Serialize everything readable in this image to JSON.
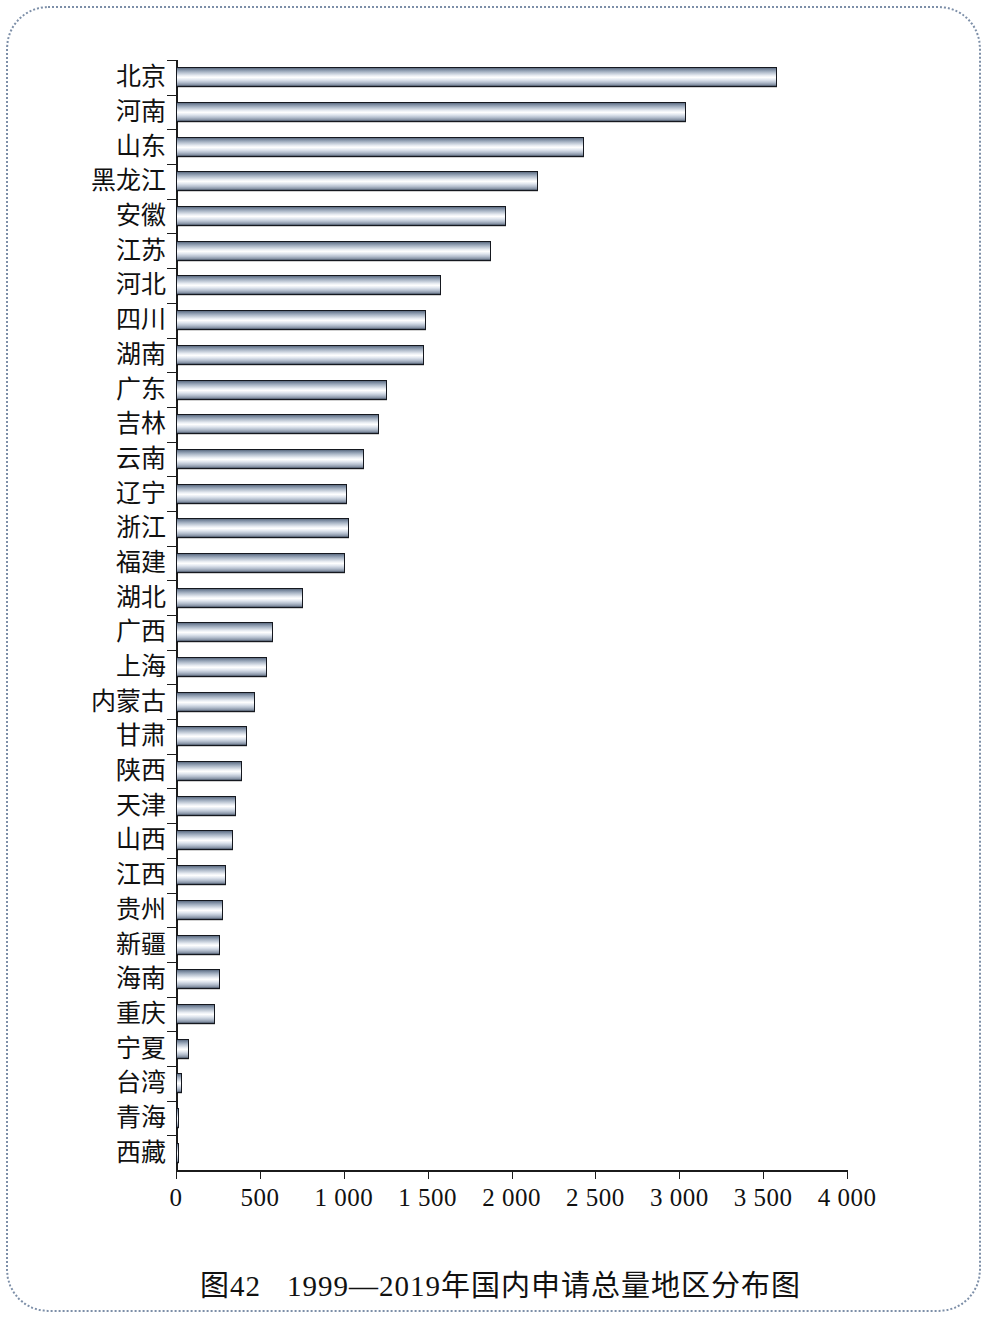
{
  "caption": {
    "figure_number": "图42",
    "title": "1999—2019年国内申请总量地区分布图"
  },
  "chart_data": {
    "type": "bar",
    "orientation": "horizontal",
    "title": "1999—2019年国内申请总量地区分布图",
    "xlabel": "",
    "ylabel": "",
    "xlim": [
      0,
      4000
    ],
    "grid": false,
    "legend": null,
    "xticks": [
      "0",
      "500",
      "1 000",
      "1 500",
      "2 000",
      "2 500",
      "3 000",
      "3 500",
      "4 000"
    ],
    "xtick_values": [
      0,
      500,
      1000,
      1500,
      2000,
      2500,
      3000,
      3500,
      4000
    ],
    "categories": [
      "北京",
      "河南",
      "山东",
      "黑龙江",
      "安徽",
      "江苏",
      "河北",
      "四川",
      "湖南",
      "广东",
      "吉林",
      "云南",
      "辽宁",
      "浙江",
      "福建",
      "湖北",
      "广西",
      "上海",
      "内蒙古",
      "甘肃",
      "陕西",
      "天津",
      "山西",
      "江西",
      "贵州",
      "新疆",
      "海南",
      "重庆",
      "宁夏",
      "台湾",
      "青海",
      "西藏"
    ],
    "values": [
      3580,
      3040,
      2430,
      2160,
      1970,
      1880,
      1580,
      1490,
      1480,
      1260,
      1210,
      1120,
      1020,
      1030,
      1010,
      755,
      580,
      540,
      470,
      425,
      395,
      360,
      340,
      300,
      280,
      265,
      260,
      230,
      75,
      35,
      15,
      12
    ],
    "bar_color": "#b6c0cf",
    "axis_color": "#1b1b1b"
  }
}
